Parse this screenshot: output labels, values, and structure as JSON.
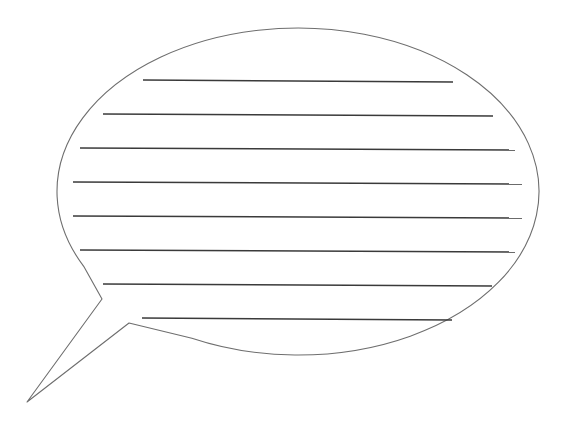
{
  "image": {
    "width": 569,
    "height": 435,
    "background": "#ffffff"
  },
  "bubble": {
    "outline_color": "#6e6e6e",
    "outline_width": 1.1,
    "fill": "#ffffff",
    "ellipse": {
      "cx": 298,
      "cy": 191.5,
      "rx": 241,
      "ry": 163.5
    },
    "tail_points": [
      [
        79,
        268
      ],
      [
        102,
        299
      ],
      [
        27,
        402
      ],
      [
        129,
        323
      ],
      [
        182,
        352
      ]
    ]
  },
  "writing_lines": {
    "color": "#3a3a3a",
    "width": 1.4,
    "lines": [
      {
        "x1": 143,
        "y1": 80,
        "x2": 453,
        "y2": 82
      },
      {
        "x1": 103,
        "y1": 114,
        "x2": 493,
        "y2": 116
      },
      {
        "x1": 80,
        "y1": 148,
        "x2": 515,
        "y2": 150
      },
      {
        "x1": 73,
        "y1": 182,
        "x2": 522,
        "y2": 184
      },
      {
        "x1": 73,
        "y1": 216,
        "x2": 522,
        "y2": 218
      },
      {
        "x1": 80,
        "y1": 250,
        "x2": 515,
        "y2": 252
      },
      {
        "x1": 103,
        "y1": 284,
        "x2": 492,
        "y2": 286
      },
      {
        "x1": 142,
        "y1": 318,
        "x2": 452,
        "y2": 320
      }
    ]
  }
}
